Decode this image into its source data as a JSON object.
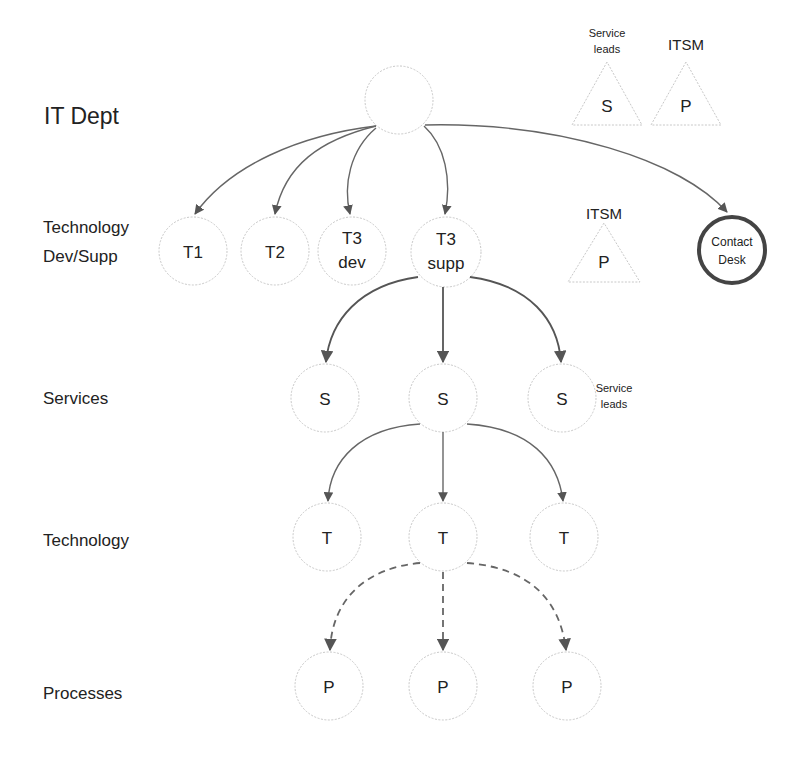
{
  "row_labels": {
    "it_dept": "IT Dept",
    "technology_line1": "Technology",
    "technology_line2": "Dev/Supp",
    "services": "Services",
    "technology": "Technology",
    "processes": "Processes"
  },
  "legend": {
    "service_leads_line1": "Service",
    "service_leads_line2": "leads",
    "service_leads_symbol": "S",
    "itsm_label": "ITSM",
    "itsm_symbol": "P"
  },
  "root_node": {
    "label": ""
  },
  "tier1_nodes": [
    {
      "line1": "T1",
      "line2": ""
    },
    {
      "line1": "T2",
      "line2": ""
    },
    {
      "line1": "T3",
      "line2": "dev"
    },
    {
      "line1": "T3",
      "line2": "supp"
    }
  ],
  "itsm_marker": {
    "label": "ITSM",
    "symbol": "P"
  },
  "contact_desk": {
    "line1": "Contact",
    "line2": "Desk"
  },
  "service_nodes": [
    "S",
    "S",
    "S"
  ],
  "service_side_label": {
    "line1": "Service",
    "line2": "leads"
  },
  "technology_nodes": [
    "T",
    "T",
    "T"
  ],
  "process_nodes": [
    "P",
    "P",
    "P"
  ],
  "colors": {
    "node_border": "#c8c8c8",
    "edge": "#666666",
    "contact_desk_border": "#444444",
    "text": "#222222"
  }
}
